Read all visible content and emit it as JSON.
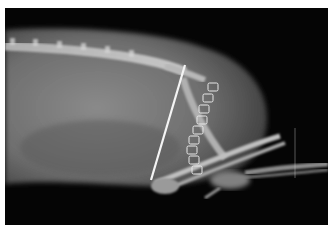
{
  "image": {
    "kind": "radiograph",
    "view": "lateral",
    "subject": "small animal body with hind limbs",
    "background_color": "#050505",
    "border_color": "#ffffff",
    "visible_features": [
      "spine",
      "abdomen",
      "intramedullary pin",
      "skin staples",
      "hind limb bones"
    ],
    "staple_count": 9
  }
}
